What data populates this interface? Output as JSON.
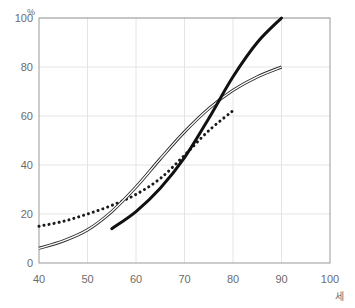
{
  "chart_data": {
    "type": "line",
    "title": "",
    "subtitle": "",
    "xlabel": "세",
    "ylabel": "%",
    "xlim": [
      40,
      100
    ],
    "ylim": [
      0,
      100
    ],
    "xticks": [
      40,
      50,
      60,
      70,
      80,
      90,
      100
    ],
    "yticks": [
      0,
      20,
      40,
      60,
      80,
      100
    ],
    "xtick_labels": [
      "40",
      "50",
      "60",
      "70",
      "80",
      "90",
      "100"
    ],
    "ytick_labels": [
      "0",
      "20",
      "40",
      "60",
      "80",
      "100"
    ],
    "grid": true,
    "grid_color": "#e4e4e4",
    "plot_border_color": "#9a9a9a",
    "background_color": "#ffffff",
    "legend": "none",
    "series": [
      {
        "name": "dotted-series",
        "style": "dotted",
        "color": "#1a1a1a",
        "width": 3,
        "x": [
          40,
          45,
          50,
          55,
          60,
          65,
          70,
          75,
          80.5
        ],
        "values": [
          15,
          17,
          20,
          23.5,
          28,
          34.5,
          44,
          54,
          63
        ]
      },
      {
        "name": "double-thin-series",
        "style": "double-solid",
        "color": "#2a2a2a",
        "width": 1,
        "x": [
          40,
          45,
          50,
          55,
          60,
          65,
          70,
          75,
          80,
          85,
          90
        ],
        "values": [
          6,
          9,
          13.5,
          21,
          31,
          42.5,
          53.5,
          63,
          70.5,
          76,
          80
        ]
      },
      {
        "name": "thick-solid-series",
        "style": "solid",
        "color": "#111111",
        "width": 3,
        "x": [
          55,
          60,
          65,
          70,
          75,
          80,
          85,
          90
        ],
        "values": [
          14,
          21,
          30.5,
          43,
          59,
          76,
          90,
          100
        ]
      }
    ]
  },
  "axes": {
    "y_unit": "%",
    "x_unit": "세"
  }
}
